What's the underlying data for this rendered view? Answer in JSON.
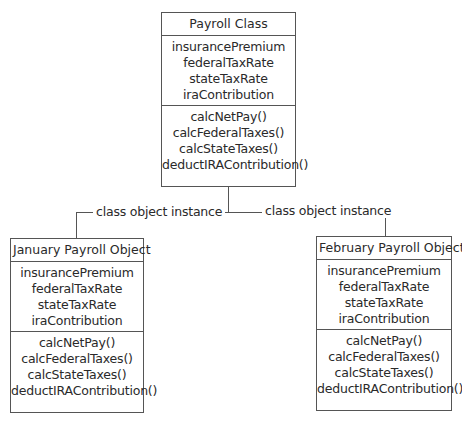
{
  "diagram": {
    "type": "class-instance diagram",
    "class_box": {
      "title": "Payroll Class",
      "attributes": [
        "insurancePremium",
        "federalTaxRate",
        "stateTaxRate",
        "iraContribution"
      ],
      "methods": [
        "calcNetPay()",
        "calcFederalTaxes()",
        "calcStateTaxes()",
        "deductIRAContribution()"
      ]
    },
    "connectors": {
      "left_label": "class object instance",
      "right_label": "class object instance"
    },
    "objects": [
      {
        "title": "January Payroll Object",
        "attributes": [
          "insurancePremium",
          "federalTaxRate",
          "stateTaxRate",
          "iraContribution"
        ],
        "methods": [
          "calcNetPay()",
          "calcFederalTaxes()",
          "calcStateTaxes()",
          "deductIRAContribution()"
        ]
      },
      {
        "title": "February Payroll Object",
        "attributes": [
          "insurancePremium",
          "federalTaxRate",
          "stateTaxRate",
          "iraContribution"
        ],
        "methods": [
          "calcNetPay()",
          "calcFederalTaxes()",
          "calcStateTaxes()",
          "deductIRAContribution()"
        ]
      }
    ],
    "colors": {
      "line": "#555555",
      "text": "#2a2a2a",
      "background": "#ffffff"
    }
  }
}
